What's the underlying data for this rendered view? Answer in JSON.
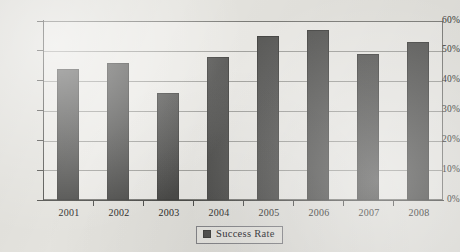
{
  "chart_data": {
    "type": "bar",
    "title": "",
    "xlabel": "",
    "ylabel": "",
    "categories": [
      "2001",
      "2002",
      "2003",
      "2004",
      "2005",
      "2006",
      "2007",
      "2008"
    ],
    "values": [
      44,
      46,
      36,
      48,
      55,
      57,
      49,
      53
    ],
    "series": [
      {
        "name": "Success Rate",
        "values": [
          44,
          46,
          36,
          48,
          55,
          57,
          49,
          53
        ],
        "color": "#4f4f4d"
      }
    ],
    "ylim": [
      0,
      60
    ],
    "ytick_values": [
      0,
      10,
      20,
      30,
      40,
      50,
      60
    ],
    "ytick_labels": [
      "0%",
      "10%",
      "20%",
      "30%",
      "40%",
      "50%",
      "60%"
    ],
    "grid": true,
    "legend_position": "bottom-center",
    "value_suffix": "%"
  },
  "legend": {
    "entries": [
      {
        "label": "Success Rate",
        "swatch_color": "#4f4f4d"
      }
    ]
  },
  "axes": {
    "y_labels": [
      "60%",
      "50%",
      "40%",
      "30%",
      "20%",
      "10%",
      "0%"
    ],
    "x_labels": [
      "2001",
      "2002",
      "2003",
      "2004",
      "2005",
      "2006",
      "2007",
      "2008"
    ]
  }
}
